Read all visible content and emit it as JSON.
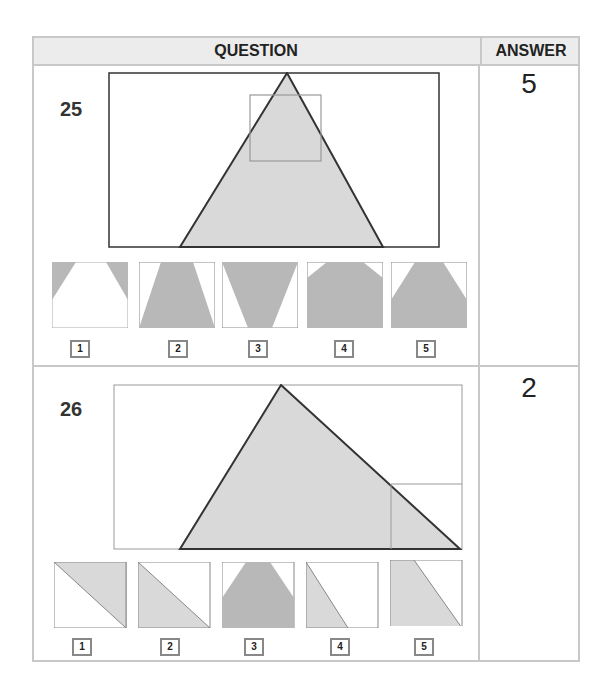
{
  "header": {
    "question_label": "QUESTION",
    "answer_label": "ANSWER"
  },
  "questions": [
    {
      "number": "25",
      "answer": "5",
      "options": [
        "1",
        "2",
        "3",
        "4",
        "5"
      ]
    },
    {
      "number": "26",
      "answer": "2",
      "options": [
        "1",
        "2",
        "3",
        "4",
        "5"
      ]
    }
  ],
  "colors": {
    "fill": "#d9d9d9",
    "dark_fill": "#b8b8b8",
    "stroke": "#333333",
    "grid": "#c8c8c8"
  }
}
